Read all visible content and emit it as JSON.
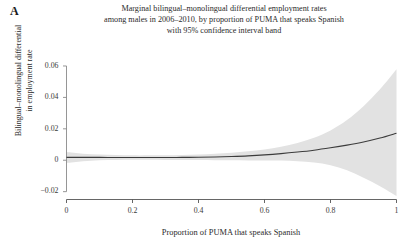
{
  "panel": {
    "label": "A"
  },
  "chart_data": {
    "type": "line",
    "title_lines": [
      "Marginal bilingual–monolingual differential employment rates",
      "among males in 2006–2010, by proportion of PUMA that speaks Spanish",
      "with 95% confidence interval band"
    ],
    "title": "Marginal bilingual–monolingual differential employment rates among males in 2006–2010, by proportion of PUMA that speaks Spanish with 95% confidence interval band",
    "xlabel": "Proportion of PUMA that speaks Spanish",
    "ylabel_lines": [
      "Bilingual–monolingual differential",
      "in employment rate"
    ],
    "ylabel": "Bilingual–monolingual differential in employment rate",
    "xlim": [
      0,
      1
    ],
    "ylim": [
      -0.025,
      0.067
    ],
    "xticks": [
      0,
      0.2,
      0.4,
      0.6,
      0.8,
      1
    ],
    "xtick_labels": [
      "0",
      "0.2",
      "0.4",
      "0.6",
      "0.8",
      "1"
    ],
    "yticks": [
      -0.02,
      0,
      0.02,
      0.04,
      0.06
    ],
    "ytick_labels": [
      "−0.02",
      "0",
      "0.02",
      "0.04",
      "0.06"
    ],
    "grid": false,
    "legend": "none",
    "band_label": "95% confidence interval",
    "colors": {
      "line": "#3c3c3c",
      "band": "#e2e2e2",
      "axis": "#8a8a8a",
      "text": "#2b2b2b"
    },
    "x": [
      0,
      0.05,
      0.1,
      0.15,
      0.2,
      0.25,
      0.3,
      0.35,
      0.4,
      0.45,
      0.5,
      0.55,
      0.6,
      0.65,
      0.7,
      0.75,
      0.8,
      0.85,
      0.9,
      0.95,
      1
    ],
    "series": [
      {
        "name": "estimate",
        "values": [
          0.0018,
          0.0018,
          0.0018,
          0.0017,
          0.0017,
          0.0017,
          0.0017,
          0.0018,
          0.0019,
          0.0021,
          0.0024,
          0.0028,
          0.0034,
          0.0042,
          0.0052,
          0.0064,
          0.0079,
          0.0096,
          0.0116,
          0.0141,
          0.0172
        ]
      },
      {
        "name": "ci_upper",
        "values": [
          0.0053,
          0.0042,
          0.0036,
          0.0033,
          0.0031,
          0.0031,
          0.0032,
          0.0034,
          0.0037,
          0.0042,
          0.0048,
          0.0057,
          0.0069,
          0.0086,
          0.011,
          0.0143,
          0.019,
          0.0256,
          0.0344,
          0.0452,
          0.058
        ]
      },
      {
        "name": "ci_lower",
        "values": [
          -0.0017,
          -0.0006,
          0.0,
          0.0002,
          0.0003,
          0.0003,
          0.0002,
          0.0002,
          0.0001,
          0.0,
          0.0,
          -0.0001,
          -0.0001,
          -0.0002,
          -0.0006,
          -0.0015,
          -0.0032,
          -0.0064,
          -0.0112,
          -0.0166,
          -0.0228
        ]
      }
    ]
  }
}
